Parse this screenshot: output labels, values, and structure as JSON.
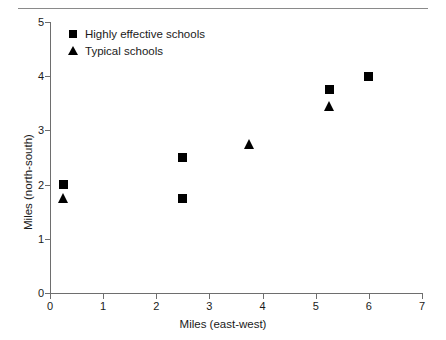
{
  "chart_data": {
    "type": "scatter",
    "title": "",
    "xlabel": "Miles (east-west)",
    "ylabel": "Miles (north-south)",
    "xlim": [
      0,
      7
    ],
    "ylim": [
      0,
      5
    ],
    "xticks": [
      "0",
      "1",
      "2",
      "3",
      "4",
      "5",
      "6",
      "7"
    ],
    "yticks": [
      "0",
      "1",
      "2",
      "3",
      "4",
      "5"
    ],
    "grid": false,
    "legend_position": "top-left",
    "series": [
      {
        "name": "Highly effective schools",
        "marker": "square",
        "color": "#000000",
        "points": [
          {
            "x": 0.25,
            "y": 2.0
          },
          {
            "x": 2.5,
            "y": 2.5
          },
          {
            "x": 2.5,
            "y": 1.75
          },
          {
            "x": 5.25,
            "y": 3.75
          },
          {
            "x": 6.0,
            "y": 4.0
          }
        ]
      },
      {
        "name": "Typical schools",
        "marker": "triangle",
        "color": "#000000",
        "points": [
          {
            "x": 0.25,
            "y": 1.75
          },
          {
            "x": 3.75,
            "y": 2.75
          },
          {
            "x": 5.25,
            "y": 3.45
          }
        ]
      }
    ]
  },
  "legend": {
    "items": [
      {
        "label": "Highly effective schools",
        "marker": "square"
      },
      {
        "label": "Typical schools",
        "marker": "triangle"
      }
    ]
  },
  "colors": {
    "marker": "#000000",
    "axis": "#6e6e6e",
    "rule": "#8a8a8a",
    "text": "#1a1a1a",
    "background": "#ffffff"
  }
}
